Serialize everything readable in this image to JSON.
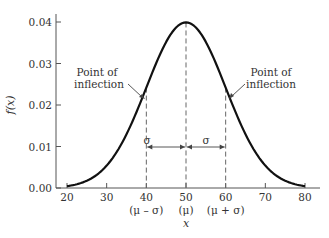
{
  "chart_data": {
    "type": "line",
    "title": "",
    "xlabel": "x",
    "ylabel": "f(x)",
    "xlim": [
      20,
      80
    ],
    "ylim": [
      0,
      0.04
    ],
    "grid": false,
    "legend": null,
    "x_ticks": [
      {
        "value": 20,
        "label": "20",
        "sublabel": ""
      },
      {
        "value": 30,
        "label": "30",
        "sublabel": ""
      },
      {
        "value": 40,
        "label": "40",
        "sublabel": "(μ – σ)"
      },
      {
        "value": 50,
        "label": "50",
        "sublabel": "(μ)"
      },
      {
        "value": 60,
        "label": "60",
        "sublabel": "(μ + σ)"
      },
      {
        "value": 70,
        "label": "70",
        "sublabel": ""
      },
      {
        "value": 80,
        "label": "80",
        "sublabel": ""
      }
    ],
    "y_ticks": [
      {
        "value": 0.0,
        "label": "0.00"
      },
      {
        "value": 0.01,
        "label": "0.01"
      },
      {
        "value": 0.02,
        "label": "0.02"
      },
      {
        "value": 0.03,
        "label": "0.03"
      },
      {
        "value": 0.04,
        "label": "0.04"
      }
    ],
    "series": [
      {
        "name": "Normal density (μ = 50, σ = 10)",
        "mu": 50,
        "sigma": 10,
        "x": [
          20,
          25,
          30,
          35,
          40,
          45,
          50,
          55,
          60,
          65,
          70,
          75,
          80
        ],
        "values": [
          0.0004,
          0.0018,
          0.0054,
          0.013,
          0.0242,
          0.0352,
          0.0399,
          0.0352,
          0.0242,
          0.013,
          0.0054,
          0.0018,
          0.0004
        ]
      }
    ],
    "annotations": [
      {
        "text_lines": [
          "Point of",
          "inflection"
        ],
        "points_to": {
          "x": 40,
          "y": 0.0242
        },
        "side": "left"
      },
      {
        "text_lines": [
          "Point of",
          "inflection"
        ],
        "points_to": {
          "x": 60,
          "y": 0.0242
        },
        "side": "right"
      },
      {
        "type": "dashed-vline",
        "x": 40
      },
      {
        "type": "dashed-vline",
        "x": 50
      },
      {
        "type": "dashed-vline",
        "x": 60
      },
      {
        "type": "double-arrow",
        "from": 40,
        "to": 50,
        "y": 0.01,
        "label": "σ"
      },
      {
        "type": "double-arrow",
        "from": 50,
        "to": 60,
        "y": 0.01,
        "label": "σ"
      }
    ]
  },
  "labels": {
    "ylabel": "f(x)",
    "xlabel": "x",
    "inflection_left_1": "Point of",
    "inflection_left_2": "inflection",
    "inflection_right_1": "Point of",
    "inflection_right_2": "inflection",
    "sigma_left": "σ",
    "sigma_right": "σ"
  },
  "colors": {
    "curve": "#111111",
    "axis": "#555555",
    "dashed": "#666666",
    "text": "#333333"
  }
}
